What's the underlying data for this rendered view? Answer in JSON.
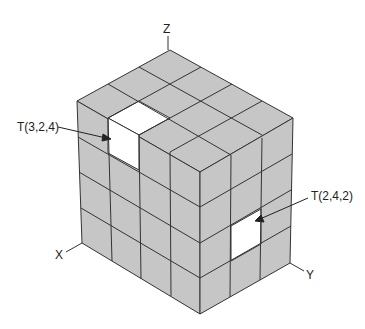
{
  "diagram": {
    "type": "isometric-cube-grid",
    "grid": {
      "x_cells": 4,
      "y_cells": 3,
      "z_layers": 4
    },
    "axes": {
      "x_label": "X",
      "y_label": "Y",
      "z_label": "Z"
    },
    "annotations": [
      {
        "id": "t324",
        "label": "T(3,2,4)",
        "highlight": "white"
      },
      {
        "id": "t242",
        "label": "T(2,4,2)",
        "highlight": "white"
      }
    ],
    "colors": {
      "face": "#c6c6c6",
      "edge": "#333333",
      "highlight": "#ffffff"
    }
  }
}
